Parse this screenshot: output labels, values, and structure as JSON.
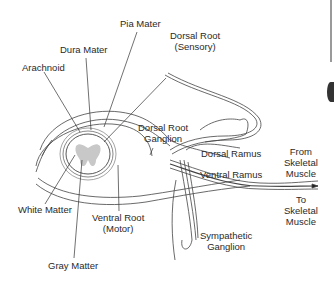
{
  "diagram": {
    "labels": {
      "pia_mater": "Pia Mater",
      "dura_mater": "Dura Mater",
      "arachnoid": "Arachnoid",
      "dorsal_root_line1": "Dorsal Root",
      "dorsal_root_line2": "(Sensory)",
      "dorsal_root_ganglion_line1": "Dorsal Root",
      "dorsal_root_ganglion_line2": "Ganglion",
      "dorsal_ramus": "Dorsal Ramus",
      "ventral_ramus": "Ventral Ramus",
      "from_line1": "From",
      "from_line2": "Skeletal",
      "from_line3": "Muscle",
      "to_line1": "To",
      "to_line2": "Skeletal",
      "to_line3": "Muscle",
      "white_matter": "White Matter",
      "ventral_root_line1": "Ventral Root",
      "ventral_root_line2": "(Motor)",
      "sympathetic_line1": "Sympathetic",
      "sympathetic_line2": "Ganglion",
      "gray_matter": "Gray Matter"
    },
    "colors": {
      "line": "#3a3a3a",
      "gray_matter": "#c8c8c8",
      "background": "#ffffff"
    }
  }
}
